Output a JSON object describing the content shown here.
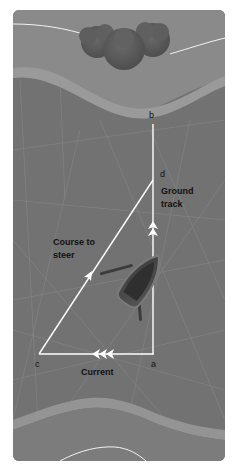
{
  "diagram": {
    "colors": {
      "panel_bg": "#7a7a7a",
      "bank_top": "#8c8c8c",
      "water": "#6e6e6e",
      "band": "#969696",
      "lines": "#ffffff",
      "text": "#111111",
      "boat": "#4a4a4a",
      "trees": "#5c5c5c"
    },
    "points": {
      "a": {
        "label": "a",
        "x": 154,
        "y": 354
      },
      "b": {
        "label": "b",
        "x": 153,
        "y": 124
      },
      "c": {
        "label": "c",
        "x": 39,
        "y": 354
      },
      "d": {
        "label": "d",
        "x": 153,
        "y": 180
      }
    },
    "labels": {
      "ground_track_line1": "Ground",
      "ground_track_line2": "track",
      "course_line1": "Course to",
      "course_line2": "steer",
      "current": "Current",
      "point_a": "a",
      "point_b": "b",
      "point_c": "c",
      "point_d": "d"
    },
    "vectors": [
      {
        "name": "ground-track",
        "from": "a",
        "to": "b",
        "arrowheads": 2
      },
      {
        "name": "course-to-steer",
        "from": "c",
        "to": "d",
        "arrowheads": 1
      },
      {
        "name": "current",
        "from": "a",
        "to": "c",
        "arrowheads": 3
      }
    ]
  }
}
